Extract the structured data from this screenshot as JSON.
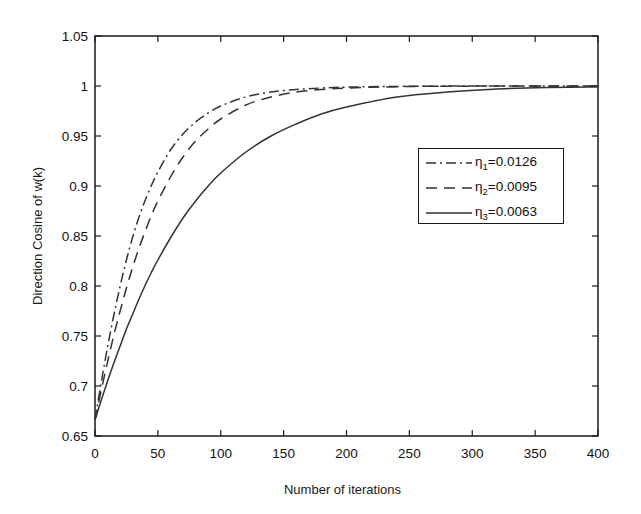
{
  "chart_data": {
    "type": "line",
    "title": "",
    "xlabel": "Number of iterations",
    "ylabel": "Direction Cosine of w(k)",
    "xlim": [
      0,
      400
    ],
    "ylim": [
      0.65,
      1.05
    ],
    "xticks": [
      0,
      50,
      100,
      150,
      200,
      250,
      300,
      350,
      400
    ],
    "yticks": [
      0.65,
      0.7,
      0.75,
      0.8,
      0.85,
      0.9,
      0.95,
      1,
      1.05
    ],
    "xtick_labels": [
      "0",
      "50",
      "100",
      "150",
      "200",
      "250",
      "300",
      "350",
      "400"
    ],
    "ytick_labels": [
      "0.65",
      "0.7",
      "0.75",
      "0.8",
      "0.85",
      "0.9",
      "0.95",
      "1",
      "1.05"
    ],
    "grid": false,
    "legend_position": "center-right",
    "ticks_all_sides": true,
    "line_color": "#333333",
    "frame_color": "#1a1a1a",
    "background": "#ffffff",
    "series": [
      {
        "name": "eta1",
        "legend_label": "η₁=0.0126",
        "legend_symbol": "η",
        "legend_subscript": "1",
        "legend_value": "=0.0126",
        "eta": 0.0126,
        "style": "dash-dot",
        "dasharray": "10,4,2,4",
        "x": [
          0,
          5,
          10,
          15,
          20,
          25,
          30,
          35,
          40,
          45,
          50,
          60,
          70,
          80,
          90,
          100,
          120,
          140,
          160,
          180,
          200,
          240,
          280,
          320,
          360,
          400
        ],
        "y": [
          0.666,
          0.704,
          0.739,
          0.771,
          0.8,
          0.826,
          0.849,
          0.869,
          0.886,
          0.901,
          0.914,
          0.936,
          0.952,
          0.964,
          0.973,
          0.98,
          0.989,
          0.994,
          0.9965,
          0.998,
          0.9989,
          0.9996,
          0.9999,
          1.0,
          1.0,
          1.0
        ]
      },
      {
        "name": "eta2",
        "legend_label": "η₂=0.0095",
        "legend_symbol": "η",
        "legend_subscript": "2",
        "legend_value": "=0.0095",
        "eta": 0.0095,
        "style": "dashed",
        "dasharray": "11,7",
        "x": [
          0,
          5,
          10,
          15,
          20,
          25,
          30,
          35,
          40,
          45,
          50,
          60,
          70,
          80,
          90,
          100,
          120,
          140,
          160,
          180,
          200,
          240,
          280,
          320,
          360,
          400
        ],
        "y": [
          0.666,
          0.696,
          0.724,
          0.751,
          0.775,
          0.798,
          0.819,
          0.838,
          0.855,
          0.871,
          0.885,
          0.909,
          0.929,
          0.945,
          0.957,
          0.967,
          0.981,
          0.989,
          0.994,
          0.9965,
          0.998,
          0.9993,
          0.9998,
          0.9999,
          1.0,
          1.0
        ]
      },
      {
        "name": "eta3",
        "legend_label": "η₃=0.0063",
        "legend_symbol": "η",
        "legend_subscript": "3",
        "legend_value": "=0.0063",
        "eta": 0.0063,
        "style": "solid",
        "dasharray": "none",
        "x": [
          0,
          5,
          10,
          15,
          20,
          25,
          30,
          35,
          40,
          45,
          50,
          60,
          70,
          80,
          90,
          100,
          120,
          140,
          160,
          180,
          200,
          240,
          280,
          320,
          360,
          400
        ],
        "y": [
          0.666,
          0.686,
          0.705,
          0.723,
          0.74,
          0.757,
          0.772,
          0.787,
          0.801,
          0.814,
          0.826,
          0.848,
          0.868,
          0.885,
          0.9,
          0.913,
          0.934,
          0.95,
          0.962,
          0.972,
          0.979,
          0.989,
          0.994,
          0.997,
          0.9985,
          0.999
        ]
      }
    ]
  }
}
